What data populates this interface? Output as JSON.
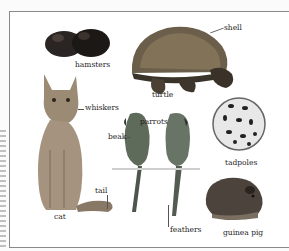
{
  "page": {
    "side_text": "(vertical page text, illegible)",
    "labels": {
      "hamsters": "hamsters",
      "shell": "shell",
      "turtle": "turtle",
      "whiskers": "whiskers",
      "parrots": "parrots",
      "beak": "beak",
      "tadpoles": "tadpoles",
      "tail": "tail",
      "cat": "cat",
      "feathers": "feathers",
      "guinea_pig": "guinea pig"
    },
    "colors": {
      "background": "#ffffff",
      "frame": "#8a8a8a",
      "text": "#1e1e1e"
    }
  }
}
